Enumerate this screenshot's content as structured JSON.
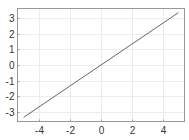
{
  "chart_data": {
    "type": "line",
    "title": "",
    "xlabel": "",
    "ylabel": "",
    "xlim": [
      -5.4,
      5.4
    ],
    "ylim": [
      -3.6,
      3.6
    ],
    "grid": true,
    "legend": null,
    "x_ticks": [
      -4,
      -2,
      0,
      2,
      4
    ],
    "y_ticks": [
      -3,
      -2,
      -1,
      0,
      1,
      2,
      3
    ],
    "x_tick_labels": [
      "-4",
      "-2",
      "0",
      "2",
      "4"
    ],
    "y_tick_labels": [
      "-3",
      "-2",
      "-1",
      "0",
      "1",
      "2",
      "3"
    ],
    "series": [
      {
        "name": "y = 2x/3",
        "color": "#666666",
        "x": [
          -5,
          5
        ],
        "y": [
          -3.33,
          3.33
        ]
      }
    ]
  },
  "colors": {
    "background": "#ffffff",
    "frame": "#999999",
    "grid": "#ececec",
    "line": "#666666",
    "tick_text": "#333333"
  }
}
